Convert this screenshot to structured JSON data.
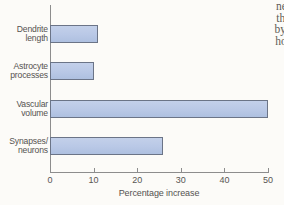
{
  "page": {
    "background_color": "#fcfbf8",
    "body_text_lines": [
      "neuror",
      "that of",
      "by inje",
      "housin"
    ]
  },
  "chart_data": {
    "type": "bar",
    "orientation": "horizontal",
    "title": "",
    "subtitle": "",
    "xlabel": "Percentage increase",
    "ylabel": "",
    "categories": [
      "Dendrite length",
      "Astrocyte processes",
      "Vascular volume",
      "Synapses/ neurons"
    ],
    "category_lines": [
      [
        "Dendrite",
        "length"
      ],
      [
        "Astrocyte",
        "processes"
      ],
      [
        "Vascular",
        "volume"
      ],
      [
        "Synapses/",
        "neurons"
      ]
    ],
    "values": [
      11,
      10,
      50,
      26
    ],
    "xlim": [
      0,
      52
    ],
    "xticks": [
      0,
      10,
      20,
      30,
      40,
      50
    ],
    "xtick_labels": [
      "0",
      "10",
      "20",
      "30",
      "40",
      "50"
    ],
    "grid": false,
    "legend": null,
    "bar_fill_color": "#b9c8e6",
    "bar_edge_color": "#6b7487",
    "axis_color": "#8d8d8d",
    "text_color": "#555250"
  }
}
